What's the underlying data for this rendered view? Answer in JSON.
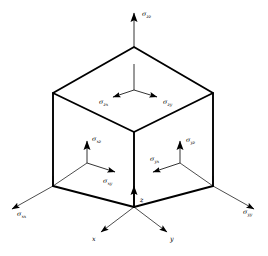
{
  "figure": {
    "background_color": "#ffffff",
    "line_color": "#000000",
    "width": 268,
    "height": 256
  },
  "cube": {
    "name": "stress-cube",
    "vertices": {
      "top_apex": [
        134,
        47
      ],
      "top_left": [
        53,
        93
      ],
      "top_right": [
        213,
        93
      ],
      "front_center": [
        134,
        132
      ],
      "bottom_left": [
        53,
        186
      ],
      "bottom_right": [
        213,
        186
      ],
      "bottom_front": [
        134,
        207
      ]
    }
  },
  "axes": {
    "x": {
      "label": "x",
      "label_x": 92,
      "label_y": 240,
      "direction": "lower-left"
    },
    "y": {
      "label": "y",
      "label_x": 150,
      "label_y": 240,
      "direction": "lower-right"
    },
    "z": {
      "label": "z",
      "label_x": 140,
      "label_y": 205,
      "direction": "up"
    }
  },
  "stresses": [
    {
      "symbol": "σ",
      "sub": "zz",
      "name": "sigma-zz",
      "face": "top",
      "label_x": 142,
      "label_y": 14
    },
    {
      "symbol": "σ",
      "sub": "zx",
      "name": "sigma-zx",
      "face": "top",
      "label_x": 99,
      "label_y": 101
    },
    {
      "symbol": "σ",
      "sub": "zy",
      "name": "sigma-zy",
      "face": "top",
      "label_x": 163,
      "label_y": 101
    },
    {
      "symbol": "σ",
      "sub": "xz",
      "name": "sigma-xz",
      "face": "left",
      "label_x": 92,
      "label_y": 138
    },
    {
      "symbol": "σ",
      "sub": "xy",
      "name": "sigma-xy",
      "face": "left",
      "label_x": 103,
      "label_y": 180
    },
    {
      "symbol": "σ",
      "sub": "xx",
      "name": "sigma-xx",
      "face": "left",
      "label_x": 17,
      "label_y": 214
    },
    {
      "symbol": "σ",
      "sub": "yz",
      "name": "sigma-yz",
      "face": "right",
      "label_x": 193,
      "label_y": 139
    },
    {
      "symbol": "σ",
      "sub": "yx",
      "name": "sigma-yx",
      "face": "right",
      "label_x": 157,
      "label_y": 163
    },
    {
      "symbol": "σ",
      "sub": "yy",
      "name": "sigma-yy",
      "face": "right",
      "label_x": 243,
      "label_y": 212
    }
  ]
}
